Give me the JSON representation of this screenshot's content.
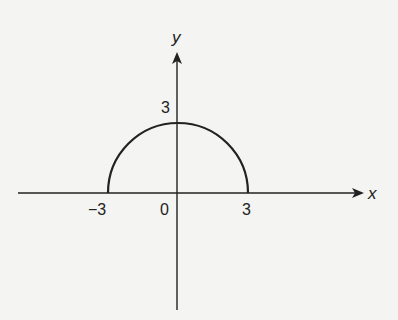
{
  "diagram": {
    "type": "coordinate-plane",
    "axes": {
      "x_label": "x",
      "y_label": "y"
    },
    "tick_labels": {
      "x_neg": "−3",
      "origin": "0",
      "x_pos": "3",
      "y_pos": "3"
    },
    "curve": {
      "shape": "semicircle",
      "center": [
        0,
        0
      ],
      "radius": 3,
      "half": "upper"
    },
    "colors": {
      "stroke": "#222222",
      "background": "#f4f4f2"
    }
  }
}
